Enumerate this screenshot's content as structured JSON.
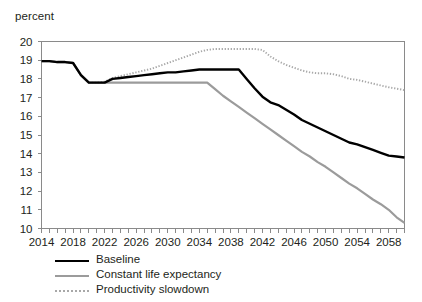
{
  "axis_unit_label": "percent",
  "legend": {
    "items": [
      {
        "label": "Baseline",
        "style": "solid",
        "color": "#000000"
      },
      {
        "label": "Constant life expectancy",
        "style": "solid",
        "color": "#9b9b9b"
      },
      {
        "label": "Productivity slowdown",
        "style": "dotted",
        "color": "#a8a8a8"
      }
    ]
  },
  "chart_data": {
    "type": "line",
    "title": "",
    "subtitle": "",
    "xlabel": "",
    "ylabel": "percent",
    "xlim": [
      2014,
      2060
    ],
    "ylim": [
      10,
      20
    ],
    "grid": false,
    "legend_position": "bottom-left",
    "y_ticks": [
      10,
      11,
      12,
      13,
      14,
      15,
      16,
      17,
      18,
      19,
      20
    ],
    "x_tick_labels": [
      2014,
      2018,
      2022,
      2026,
      2030,
      2034,
      2038,
      2042,
      2046,
      2050,
      2054,
      2058
    ],
    "x_minor_tick_step": 1,
    "x": [
      2014,
      2015,
      2016,
      2017,
      2018,
      2019,
      2020,
      2021,
      2022,
      2023,
      2024,
      2025,
      2026,
      2027,
      2028,
      2029,
      2030,
      2031,
      2032,
      2033,
      2034,
      2035,
      2036,
      2037,
      2038,
      2039,
      2040,
      2041,
      2042,
      2043,
      2044,
      2045,
      2046,
      2047,
      2048,
      2049,
      2050,
      2051,
      2052,
      2053,
      2054,
      2055,
      2056,
      2057,
      2058,
      2059,
      2060
    ],
    "series": [
      {
        "name": "Baseline",
        "color": "#000000",
        "style": "solid",
        "values": [
          18.95,
          18.95,
          18.9,
          18.9,
          18.85,
          18.2,
          17.8,
          17.8,
          17.8,
          18.0,
          18.05,
          18.1,
          18.15,
          18.2,
          18.25,
          18.3,
          18.35,
          18.35,
          18.4,
          18.45,
          18.5,
          18.5,
          18.5,
          18.5,
          18.5,
          18.5,
          18.0,
          17.5,
          17.05,
          16.75,
          16.6,
          16.35,
          16.1,
          15.8,
          15.6,
          15.4,
          15.2,
          15.0,
          14.8,
          14.6,
          14.5,
          14.35,
          14.2,
          14.05,
          13.9,
          13.85,
          13.8
        ]
      },
      {
        "name": "Constant life expectancy",
        "color": "#9b9b9b",
        "style": "solid",
        "values": [
          18.95,
          18.95,
          18.9,
          18.9,
          18.85,
          18.2,
          17.8,
          17.8,
          17.8,
          17.8,
          17.8,
          17.8,
          17.8,
          17.8,
          17.8,
          17.8,
          17.8,
          17.8,
          17.8,
          17.8,
          17.8,
          17.8,
          17.45,
          17.1,
          16.8,
          16.5,
          16.2,
          15.9,
          15.6,
          15.3,
          15.0,
          14.7,
          14.4,
          14.1,
          13.85,
          13.55,
          13.3,
          13.0,
          12.7,
          12.4,
          12.15,
          11.85,
          11.55,
          11.3,
          11.0,
          10.6,
          10.3
        ]
      },
      {
        "name": "Productivity slowdown",
        "color": "#a8a8a8",
        "style": "dotted",
        "values": [
          18.95,
          18.95,
          18.9,
          18.9,
          18.85,
          18.2,
          17.8,
          17.8,
          17.85,
          18.05,
          18.15,
          18.25,
          18.35,
          18.45,
          18.55,
          18.7,
          18.85,
          19.0,
          19.15,
          19.3,
          19.45,
          19.55,
          19.6,
          19.6,
          19.6,
          19.6,
          19.6,
          19.6,
          19.55,
          19.2,
          18.95,
          18.75,
          18.6,
          18.45,
          18.35,
          18.3,
          18.3,
          18.25,
          18.15,
          18.0,
          17.95,
          17.85,
          17.75,
          17.65,
          17.55,
          17.48,
          17.4
        ]
      }
    ]
  }
}
